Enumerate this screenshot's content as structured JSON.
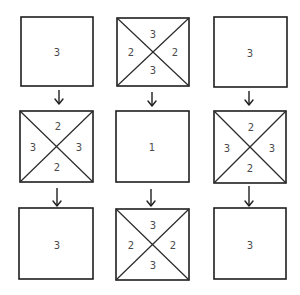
{
  "diagram": {
    "colors": {
      "line": "#1e1e1e",
      "label": "#4a4a4a",
      "background": "#ffffff"
    },
    "cells": [
      {
        "row": 0,
        "col": 0,
        "type": "plain",
        "labels": {
          "center": "3"
        }
      },
      {
        "row": 0,
        "col": 1,
        "type": "crossed",
        "labels": {
          "top": "3",
          "left": "2",
          "right": "2",
          "bottom": "3"
        }
      },
      {
        "row": 0,
        "col": 2,
        "type": "plain",
        "labels": {
          "center": "3"
        }
      },
      {
        "row": 1,
        "col": 0,
        "type": "crossed",
        "labels": {
          "top": "2",
          "left": "3",
          "right": "3",
          "bottom": "2"
        }
      },
      {
        "row": 1,
        "col": 1,
        "type": "plain",
        "labels": {
          "center": "1"
        }
      },
      {
        "row": 1,
        "col": 2,
        "type": "crossed",
        "labels": {
          "top": "2",
          "left": "3",
          "right": "3",
          "bottom": "2"
        }
      },
      {
        "row": 2,
        "col": 0,
        "type": "plain",
        "labels": {
          "center": "3"
        }
      },
      {
        "row": 2,
        "col": 1,
        "type": "crossed",
        "labels": {
          "top": "3",
          "left": "2",
          "right": "2",
          "bottom": "3"
        }
      },
      {
        "row": 2,
        "col": 2,
        "type": "plain",
        "labels": {
          "center": "3"
        }
      }
    ],
    "arrows": [
      {
        "from": "r0c0",
        "to": "r1c0",
        "direction": "down"
      },
      {
        "from": "r0c1",
        "to": "r1c1",
        "direction": "down"
      },
      {
        "from": "r0c2",
        "to": "r1c2",
        "direction": "down"
      },
      {
        "from": "r1c0",
        "to": "r2c0",
        "direction": "down"
      },
      {
        "from": "r1c1",
        "to": "r2c1",
        "direction": "down"
      },
      {
        "from": "r1c2",
        "to": "r2c2",
        "direction": "down"
      }
    ]
  },
  "labels": {
    "r0c0": {
      "center": "3"
    },
    "r0c1": {
      "top": "3",
      "left": "2",
      "right": "2",
      "bottom": "3"
    },
    "r0c2": {
      "center": "3"
    },
    "r1c0": {
      "top": "2",
      "left": "3",
      "right": "3",
      "bottom": "2"
    },
    "r1c1": {
      "center": "1"
    },
    "r1c2": {
      "top": "2",
      "left": "3",
      "right": "3",
      "bottom": "2"
    },
    "r2c0": {
      "center": "3"
    },
    "r2c1": {
      "top": "3",
      "left": "2",
      "right": "2",
      "bottom": "3"
    },
    "r2c2": {
      "center": "3"
    }
  }
}
